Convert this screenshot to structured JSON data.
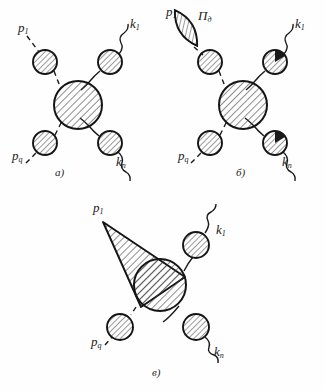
{
  "figure": {
    "type": "scanned-line-drawing",
    "background_color": "#fefefe",
    "ink_color": "#1a1a1a",
    "hatch_color": "#3a3a3a",
    "blob_fill": "#ffffff"
  },
  "panels": [
    {
      "id": "a",
      "caption": "а)",
      "caption_pos": {
        "x": 55,
        "y": 168
      },
      "center_blob": {
        "cx": 78,
        "cy": 105,
        "r": 24
      },
      "nodes": [
        {
          "name": "in-upper-blob",
          "cx": 45,
          "cy": 62,
          "r": 12
        },
        {
          "name": "out-upper-blob",
          "cx": 110,
          "cy": 62,
          "r": 12
        },
        {
          "name": "in-lower-blob",
          "cx": 45,
          "cy": 143,
          "r": 12
        },
        {
          "name": "out-lower-blob",
          "cx": 110,
          "cy": 143,
          "r": 12
        }
      ],
      "labels": [
        {
          "name": "momentum-p1",
          "base": "p",
          "sub": "1",
          "x": 18,
          "y": 26
        },
        {
          "name": "momentum-k1",
          "base": "k",
          "sub": "1",
          "x": 130,
          "y": 22
        },
        {
          "name": "momentum-pq",
          "base": "p",
          "sub": "q",
          "x": 16,
          "y": 152
        },
        {
          "name": "momentum-kn",
          "base": "k",
          "sub": "n",
          "x": 118,
          "y": 158
        }
      ]
    },
    {
      "id": "b",
      "caption": "б)",
      "caption_pos": {
        "x": 236,
        "y": 168
      },
      "center_blob": {
        "cx": 243,
        "cy": 105,
        "r": 24
      },
      "lens": {
        "name": "self-energy-lens",
        "cx": 186,
        "cy": 28,
        "rx": 13,
        "ry": 21,
        "rot": -30
      },
      "nodes": [
        {
          "name": "in-upper-blob",
          "cx": 210,
          "cy": 62,
          "r": 12
        },
        {
          "name": "out-upper-blob",
          "cx": 275,
          "cy": 62,
          "r": 12
        },
        {
          "name": "in-lower-blob",
          "cx": 210,
          "cy": 143,
          "r": 12
        },
        {
          "name": "out-lower-blob",
          "cx": 275,
          "cy": 143,
          "r": 12
        }
      ],
      "labels": [
        {
          "name": "momentum-p1",
          "base": "p",
          "sub": "1",
          "x": 166,
          "y": 8
        },
        {
          "name": "operator-pi",
          "base": "П",
          "sub": "д",
          "x": 198,
          "y": 12
        },
        {
          "name": "momentum-k1",
          "base": "k",
          "sub": "1",
          "x": 296,
          "y": 22
        },
        {
          "name": "momentum-pq",
          "base": "p",
          "sub": "q",
          "x": 181,
          "y": 152
        },
        {
          "name": "momentum-kn",
          "base": "k",
          "sub": "n",
          "x": 284,
          "y": 158
        }
      ]
    },
    {
      "id": "c",
      "caption": "в)",
      "caption_pos": {
        "x": 152,
        "y": 368
      },
      "center_blob": {
        "cx": 160,
        "cy": 285,
        "r": 26
      },
      "cone": {
        "name": "coherent-cone",
        "apex_x": 103,
        "apex_y": 222,
        "base_cx": 160,
        "base_cy": 285,
        "base_r": 26
      },
      "nodes": [
        {
          "name": "out-upper-blob",
          "cx": 196,
          "cy": 245,
          "r": 13
        },
        {
          "name": "in-lower-blob",
          "cx": 120,
          "cy": 327,
          "r": 13
        },
        {
          "name": "out-lower-blob",
          "cx": 196,
          "cy": 327,
          "r": 13
        }
      ],
      "labels": [
        {
          "name": "momentum-p1",
          "base": "p",
          "sub": "1",
          "x": 93,
          "y": 205
        },
        {
          "name": "momentum-k1",
          "base": "k",
          "sub": "1",
          "x": 218,
          "y": 228
        },
        {
          "name": "momentum-pq",
          "base": "p",
          "sub": "q",
          "x": 93,
          "y": 338
        },
        {
          "name": "momentum-kn",
          "base": "k",
          "sub": "n",
          "x": 216,
          "y": 348
        }
      ]
    }
  ]
}
